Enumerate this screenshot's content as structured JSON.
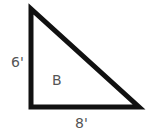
{
  "diagram": {
    "shape": "right-triangle",
    "label": "B",
    "side_vertical": "6'",
    "side_horizontal": "8'",
    "stroke_color": "#111111",
    "text_color": "#555555"
  }
}
